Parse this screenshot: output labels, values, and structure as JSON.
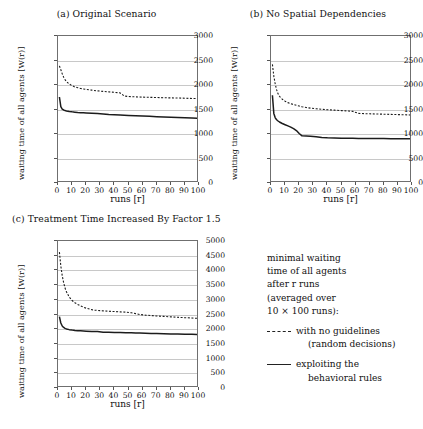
{
  "figure": {
    "xlabel": "runs [r]",
    "ylabel": "waiting time of all agents [W(r)]"
  },
  "legend": {
    "lines": [
      "minimal waiting",
      "time of all agents",
      "after r runs",
      "(averaged over",
      "10 × 100 runs):"
    ],
    "entries": [
      {
        "style": "dashed",
        "label": "with no guidelines",
        "label2": "(random decisions)"
      },
      {
        "style": "solid",
        "label": "exploiting the",
        "label2": "behavioral rules"
      }
    ]
  },
  "chart_data": [
    {
      "type": "line",
      "panel": "a",
      "title": "(a) Original Scenario",
      "xlabel": "runs [r]",
      "ylabel": "waiting time of all agents [W(r)]",
      "xlim": [
        0,
        100
      ],
      "ylim": [
        0,
        3000
      ],
      "xticks": [
        0,
        10,
        20,
        30,
        40,
        50,
        60,
        70,
        80,
        90,
        100
      ],
      "yticks": [
        0,
        500,
        1000,
        1500,
        2000,
        2500,
        3000
      ],
      "grid": true,
      "x": [
        1,
        2,
        3,
        4,
        5,
        6,
        8,
        10,
        12,
        14,
        16,
        18,
        20,
        24,
        28,
        32,
        36,
        40,
        44,
        47,
        50,
        55,
        60,
        65,
        70,
        75,
        80,
        85,
        90,
        95,
        100
      ],
      "series": [
        {
          "name": "with no guidelines (random decisions)",
          "style": "dashed",
          "values": [
            2390,
            2310,
            2230,
            2160,
            2110,
            2070,
            2020,
            1985,
            1960,
            1945,
            1930,
            1920,
            1910,
            1895,
            1880,
            1870,
            1860,
            1850,
            1840,
            1775,
            1765,
            1758,
            1752,
            1748,
            1744,
            1740,
            1737,
            1734,
            1730,
            1726,
            1722
          ]
        },
        {
          "name": "exploiting the behavioral rules",
          "style": "solid",
          "values": [
            1755,
            1560,
            1510,
            1490,
            1478,
            1470,
            1460,
            1452,
            1446,
            1440,
            1436,
            1432,
            1428,
            1422,
            1416,
            1410,
            1398,
            1392,
            1386,
            1382,
            1378,
            1372,
            1366,
            1360,
            1354,
            1348,
            1342,
            1338,
            1333,
            1328,
            1322
          ]
        }
      ]
    },
    {
      "type": "line",
      "panel": "b",
      "title": "(b) No Spatial Dependencies",
      "xlabel": "runs [r]",
      "ylabel": "waiting time of all agents [W(r)]",
      "xlim": [
        0,
        100
      ],
      "ylim": [
        0,
        3000
      ],
      "xticks": [
        0,
        10,
        20,
        30,
        40,
        50,
        60,
        70,
        80,
        90,
        100
      ],
      "yticks": [
        0,
        500,
        1000,
        1500,
        2000,
        2500,
        3000
      ],
      "grid": true,
      "x": [
        1,
        2,
        3,
        4,
        5,
        6,
        8,
        10,
        12,
        14,
        16,
        18,
        20,
        22,
        25,
        28,
        32,
        36,
        40,
        45,
        50,
        55,
        58,
        62,
        66,
        70,
        75,
        80,
        85,
        90,
        95,
        100
      ],
      "series": [
        {
          "name": "with no guidelines (random decisions)",
          "style": "dashed",
          "values": [
            2420,
            2180,
            2020,
            1900,
            1820,
            1770,
            1710,
            1670,
            1640,
            1620,
            1600,
            1585,
            1570,
            1556,
            1540,
            1528,
            1515,
            1505,
            1496,
            1487,
            1478,
            1468,
            1462,
            1420,
            1415,
            1412,
            1408,
            1404,
            1400,
            1396,
            1392,
            1388
          ]
        },
        {
          "name": "exploiting the behavioral rules",
          "style": "solid",
          "values": [
            1790,
            1420,
            1330,
            1290,
            1265,
            1245,
            1215,
            1190,
            1165,
            1140,
            1110,
            1070,
            1010,
            962,
            958,
            952,
            946,
            930,
            922,
            918,
            915,
            913,
            911,
            910,
            909,
            908,
            907,
            906,
            905,
            904,
            903,
            902
          ]
        }
      ]
    },
    {
      "type": "line",
      "panel": "c",
      "title": "(c) Treatment Time Increased By Factor 1.5",
      "xlabel": "runs [r]",
      "ylabel": "waiting time of all agents [W(r)]",
      "xlim": [
        0,
        100
      ],
      "ylim": [
        0,
        5000
      ],
      "xticks": [
        0,
        10,
        20,
        30,
        40,
        50,
        60,
        70,
        80,
        90,
        100
      ],
      "yticks": [
        0,
        500,
        1000,
        1500,
        2000,
        2500,
        3000,
        3500,
        4000,
        4500,
        5000
      ],
      "grid": true,
      "x": [
        1,
        2,
        3,
        4,
        5,
        6,
        8,
        10,
        12,
        14,
        16,
        18,
        20,
        24,
        26,
        28,
        32,
        36,
        40,
        44,
        48,
        52,
        55,
        58,
        62,
        66,
        70,
        75,
        80,
        85,
        90,
        95,
        100
      ],
      "series": [
        {
          "name": "with no guidelines (random decisions)",
          "style": "dashed",
          "values": [
            4620,
            4150,
            3820,
            3580,
            3400,
            3270,
            3090,
            2975,
            2900,
            2840,
            2790,
            2750,
            2715,
            2665,
            2650,
            2640,
            2625,
            2612,
            2600,
            2590,
            2580,
            2560,
            2530,
            2500,
            2480,
            2465,
            2450,
            2435,
            2420,
            2405,
            2392,
            2380,
            2368
          ]
        },
        {
          "name": "exploiting the behavioral rules",
          "style": "solid",
          "values": [
            2430,
            2210,
            2110,
            2060,
            2030,
            2010,
            1985,
            1970,
            1958,
            1950,
            1944,
            1939,
            1934,
            1926,
            1922,
            1918,
            1900,
            1893,
            1888,
            1884,
            1880,
            1876,
            1872,
            1868,
            1862,
            1856,
            1850,
            1844,
            1838,
            1834,
            1830,
            1826,
            1822
          ]
        }
      ]
    }
  ]
}
